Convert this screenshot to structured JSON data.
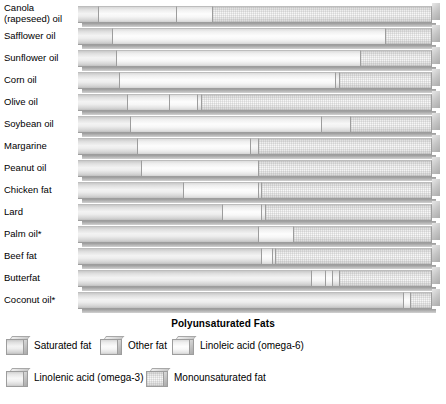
{
  "chart_data": {
    "type": "bar",
    "subtype": "100% stacked horizontal bar",
    "title": "",
    "xlabel": "Polyunsaturated Fats",
    "ylabel": "",
    "xlim": [
      0,
      100
    ],
    "grid": false,
    "legend_position": "bottom-left",
    "units": "percent of total fat",
    "categories": [
      "Canola (rapeseed) oil",
      "Safflower oil",
      "Sunflower oil",
      "Corn oil",
      "Olive oil",
      "Soybean oil",
      "Margarine",
      "Peanut oil",
      "Chicken fat",
      "Lard",
      "Palm oil*",
      "Beef fat",
      "Butterfat",
      "Coconut oil*"
    ],
    "series": [
      {
        "name": "Saturated fat",
        "key": "saturated",
        "values": [
          6,
          10,
          11,
          12,
          14,
          15,
          17,
          18,
          30,
          41,
          51,
          52,
          66,
          92
        ]
      },
      {
        "name": "Other fat",
        "key": "other",
        "values": [
          22,
          0,
          0,
          0,
          12,
          0,
          0,
          0,
          0,
          0,
          0,
          0,
          4,
          0
        ]
      },
      {
        "name": "Linoleic acid (omega-6)",
        "key": "linoleic",
        "values": [
          10,
          77,
          69,
          61,
          8,
          54,
          32,
          33,
          21,
          11,
          10,
          3,
          2,
          2
        ]
      },
      {
        "name": "Linolenic acid (omega-3)",
        "key": "linolenic",
        "values": [
          0,
          0,
          0,
          1,
          1,
          8,
          2,
          0,
          1,
          1,
          0,
          1,
          2,
          0
        ]
      },
      {
        "name": "Monounsaturated fat",
        "key": "mono",
        "values": [
          62,
          13,
          20,
          26,
          65,
          23,
          49,
          49,
          48,
          47,
          39,
          44,
          26,
          6
        ]
      }
    ],
    "footnote_marker": "*",
    "colors": {
      "saturated": "#e8e8e8",
      "other": "#f4f4f4",
      "linoleic": "#f7f7f7",
      "linolenic": "#eeeeee",
      "mono": "#e4e4e4",
      "outline": "#9d9d9d",
      "background": "#ffffff"
    }
  },
  "axis": {
    "title": "Polyunsaturated Fats"
  },
  "legend": {
    "rows": [
      [
        {
          "label": "Saturated fat",
          "key": "saturated"
        },
        {
          "label": "Other fat",
          "key": "other"
        },
        {
          "label": "Linoleic acid (omega-6)",
          "key": "linoleic"
        }
      ],
      [
        {
          "label": "Linolenic acid (omega-3)",
          "key": "linolenic"
        },
        {
          "label": "Monounsaturated fat",
          "key": "mono"
        }
      ]
    ]
  }
}
